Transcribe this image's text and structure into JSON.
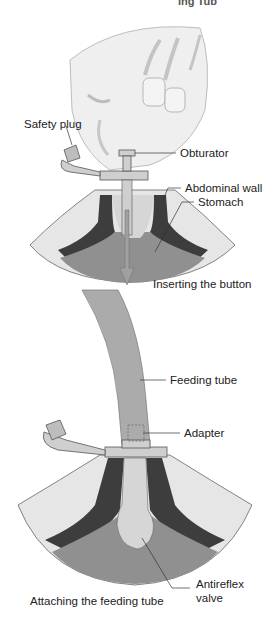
{
  "header": {
    "title_fragment": "ing Tub"
  },
  "figures": [
    {
      "id": "inserting",
      "caption": "Inserting the button",
      "labels": {
        "safety_plug": "Safety plug",
        "obturator": "Obturator",
        "abdominal_wall": "Abdominal wall",
        "stomach": "Stomach"
      }
    },
    {
      "id": "attaching",
      "caption": "Attaching the feeding tube",
      "labels": {
        "feeding_tube": "Feeding tube",
        "adapter": "Adapter",
        "antireflex_valve_line1": "Antireflex",
        "antireflex_valve_line2": "valve"
      }
    }
  ],
  "colors": {
    "skin": "#e4e4e4",
    "wall_dark": "#3d3d3d",
    "stomach": "#8f8f8f",
    "device": "#cfcfcf",
    "tube": "#a9a9a9",
    "hand": "#eeeeee",
    "outline": "#555555"
  }
}
